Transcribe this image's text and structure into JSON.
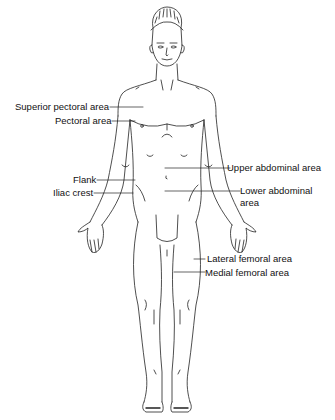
{
  "diagram": {
    "type": "anatomical-regions",
    "labels": {
      "superior_pectoral": "Superior pectoral area",
      "pectoral": "Pectoral area",
      "flank": "Flank",
      "iliac_crest": "Iliac crest",
      "upper_abdominal": "Upper abdominal area",
      "lower_abdominal_1": "Lower abdominal",
      "lower_abdominal_2": "area",
      "lateral_femoral": "Lateral femoral area",
      "medial_femoral": "Medial femoral area"
    },
    "colors": {
      "line": "#222222",
      "background": "#ffffff"
    }
  }
}
